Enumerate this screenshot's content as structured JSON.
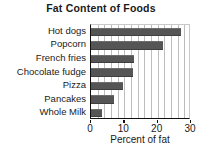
{
  "chart_data": {
    "type": "bar",
    "orientation": "horizontal",
    "title": "Fat Content of Foods",
    "xlabel": "Percent of fat",
    "ylabel": "",
    "categories": [
      "Hot dogs",
      "Popcorn",
      "French fries",
      "Chocolate fudge",
      "Pizza",
      "Pancakes",
      "Whole Milk"
    ],
    "values": [
      27,
      21.5,
      13,
      12.5,
      9.5,
      6.8,
      3.2
    ],
    "xlim": [
      0,
      30
    ],
    "xticks": [
      0,
      10,
      20,
      30
    ],
    "xtick_labels": [
      "0",
      "10",
      "20",
      "30"
    ],
    "gridlines": [
      2,
      4,
      6,
      8,
      10,
      12,
      14,
      16,
      18,
      20,
      22,
      24,
      26,
      28
    ],
    "grid": true,
    "legend": "none",
    "bar_color": "#555555",
    "grid_color": "#bdbdbd",
    "axis_color": "#111111",
    "background": "#ffffff"
  }
}
